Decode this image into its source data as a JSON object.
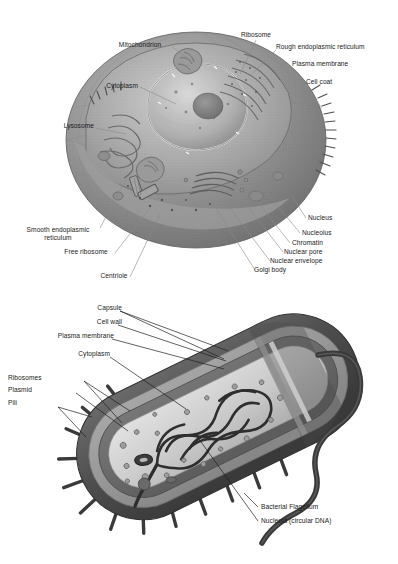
{
  "document": {
    "title": "Cell structure diagrams",
    "background_color": "#ffffff",
    "ink_color": "#1a1a1a"
  },
  "figures": [
    {
      "id": "animal-cell",
      "name": "Animal (eukaryotic) cell cutaway",
      "labels": [
        {
          "id": "mitochondrion",
          "text": "Mitochondrion",
          "align": "center"
        },
        {
          "id": "ribosome",
          "text": "Ribosome",
          "align": "center"
        },
        {
          "id": "rough-er",
          "text": "Rough endoplasmic reticulum",
          "align": "left"
        },
        {
          "id": "plasma-membrane",
          "text": "Plasma membrane",
          "align": "left"
        },
        {
          "id": "cell-coat",
          "text": "Cell coat",
          "align": "left"
        },
        {
          "id": "cytoplasm",
          "text": "Cytoplasm",
          "align": "right"
        },
        {
          "id": "lysosome",
          "text": "Lysosome",
          "align": "right"
        },
        {
          "id": "smooth-er",
          "text": "Smooth endoplasmic\nreticulum",
          "align": "center"
        },
        {
          "id": "free-ribosome",
          "text": "Free ribosome",
          "align": "center"
        },
        {
          "id": "centriole",
          "text": "Centriole",
          "align": "center"
        },
        {
          "id": "nucleus",
          "text": "Nucleus",
          "align": "left"
        },
        {
          "id": "nucleolus",
          "text": "Nucleolus",
          "align": "left"
        },
        {
          "id": "chromatin",
          "text": "Chromatin",
          "align": "left"
        },
        {
          "id": "nuclear-pore",
          "text": "Nuclear pore",
          "align": "left"
        },
        {
          "id": "nuclear-envelope",
          "text": "Nuclear envelope",
          "align": "left"
        },
        {
          "id": "golgi-body",
          "text": "Golgi body",
          "align": "left"
        }
      ]
    },
    {
      "id": "bacterial-cell",
      "name": "Bacterial (prokaryotic) cell cutaway",
      "labels": [
        {
          "id": "capsule",
          "text": "Capsule",
          "align": "right"
        },
        {
          "id": "cell-wall",
          "text": "Cell wall",
          "align": "right"
        },
        {
          "id": "plasma-membrane",
          "text": "Plasma membrane",
          "align": "right"
        },
        {
          "id": "cytoplasm",
          "text": "Cytoplasm",
          "align": "right"
        },
        {
          "id": "ribosomes",
          "text": "Ribosomes",
          "align": "left"
        },
        {
          "id": "plasmid",
          "text": "Plasmid",
          "align": "left"
        },
        {
          "id": "pili",
          "text": "Pili",
          "align": "left"
        },
        {
          "id": "bacterial-flagellum",
          "text": "Bacterial Flagellum",
          "align": "left"
        },
        {
          "id": "nucleoid",
          "text": "Nucleoid (circular DNA)",
          "align": "left"
        }
      ]
    }
  ]
}
